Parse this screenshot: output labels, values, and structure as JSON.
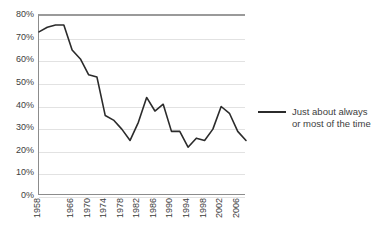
{
  "chart_data": {
    "type": "line",
    "title": "",
    "subtitle": "",
    "xlabel": "",
    "ylabel": "",
    "ylim": [
      0,
      80
    ],
    "xlim": [
      1958,
      2008
    ],
    "grid": true,
    "grid_axis": "y",
    "legend_position": "right",
    "y_ticks": [
      "0%",
      "10%",
      "20%",
      "30%",
      "40%",
      "50%",
      "60%",
      "70%",
      "80%"
    ],
    "y_tick_values": [
      0,
      10,
      20,
      30,
      40,
      50,
      60,
      70,
      80
    ],
    "x_ticks": [
      "1958",
      "1966",
      "1970",
      "1974",
      "1978",
      "1982",
      "1986",
      "1990",
      "1994",
      "1998",
      "2002",
      "2006"
    ],
    "x_tick_values": [
      1958,
      1966,
      1970,
      1974,
      1978,
      1982,
      1986,
      1990,
      1994,
      1998,
      2002,
      2006
    ],
    "series": [
      {
        "name": "Just about always\nor most of the time",
        "color": "#2b2b2b",
        "x": [
          1958,
          1960,
          1962,
          1964,
          1966,
          1968,
          1970,
          1972,
          1974,
          1976,
          1978,
          1980,
          1982,
          1984,
          1986,
          1988,
          1990,
          1992,
          1994,
          1996,
          1998,
          2000,
          2002,
          2004,
          2006,
          2008
        ],
        "values": [
          73,
          75,
          76,
          76,
          65,
          61,
          54,
          53,
          36,
          34,
          30,
          25,
          33,
          44,
          38,
          41,
          29,
          29,
          22,
          26,
          25,
          30,
          40,
          37,
          29,
          25
        ]
      }
    ]
  },
  "legend": {
    "label": "Just about always\nor most of the time"
  },
  "colors": {
    "series_line": "#2b2b2b",
    "gridline": "#e2e2e2",
    "axis": "#8c8c8c",
    "plot_top_border": "#9a9a9a",
    "text": "#3d3d3d",
    "background": "#ffffff"
  }
}
